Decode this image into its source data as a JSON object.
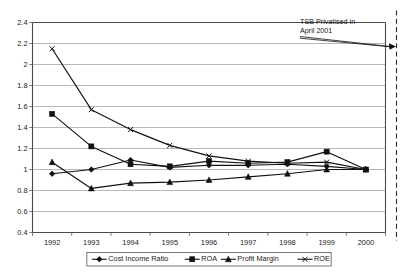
{
  "chart_data": {
    "type": "line",
    "title": "",
    "xlabel": "",
    "ylabel": "",
    "categories": [
      "1992",
      "1993",
      "1994",
      "1995",
      "1996",
      "1997",
      "1998",
      "1999",
      "2000"
    ],
    "ylim": [
      0.4,
      2.4
    ],
    "ytick_step": 0.2,
    "yticks": [
      "0.4",
      "0.6",
      "0.8",
      "1",
      "1.2",
      "1.4",
      "1.6",
      "1.8",
      "2",
      "2.2",
      "2.4"
    ],
    "grid": true,
    "legend_position": "bottom",
    "series": [
      {
        "name": "Cost Income Ratio",
        "marker": "diamond",
        "values": [
          0.96,
          1.0,
          1.09,
          1.02,
          1.04,
          1.04,
          1.05,
          1.03,
          1.0
        ]
      },
      {
        "name": "ROA",
        "marker": "square",
        "values": [
          1.53,
          1.22,
          1.05,
          1.03,
          1.08,
          1.06,
          1.07,
          1.17,
          1.0
        ]
      },
      {
        "name": "Profit Margin",
        "marker": "triangle",
        "values": [
          1.07,
          0.82,
          0.87,
          0.88,
          0.9,
          0.93,
          0.96,
          1.0,
          1.0
        ]
      },
      {
        "name": "ROE",
        "marker": "cross",
        "values": [
          2.15,
          1.57,
          1.38,
          1.23,
          1.13,
          1.08,
          1.06,
          1.07,
          1.0
        ]
      }
    ],
    "annotations": [
      {
        "id": "tsb-privatised",
        "lines": [
          "TSB Privatised in",
          "April 2001"
        ],
        "text": "TSB Privatised in April 2001",
        "points_to": "event-line-2001"
      }
    ],
    "event_lines": [
      {
        "id": "event-line-2001",
        "style": "dashed",
        "label": ""
      }
    ]
  },
  "colors": {
    "series": "#111111",
    "grid": "#9a9a9a",
    "axis": "#4a4a4a",
    "event_line": "#2a2a2a",
    "background": "#ffffff"
  }
}
